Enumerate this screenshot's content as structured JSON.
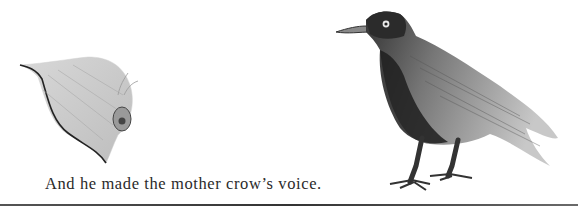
{
  "page": {
    "caption": "And he made the mother crow’s voice.",
    "illustrations": [
      {
        "name": "leaf-snail-illustration",
        "description": "pencil sketch of a leaf with a small snail"
      },
      {
        "name": "crow-illustration",
        "description": "pencil sketch of a standing crow facing left"
      }
    ],
    "colors": {
      "ink": "#2a2a2a",
      "background": "#ffffff",
      "rule": "#444444"
    }
  }
}
